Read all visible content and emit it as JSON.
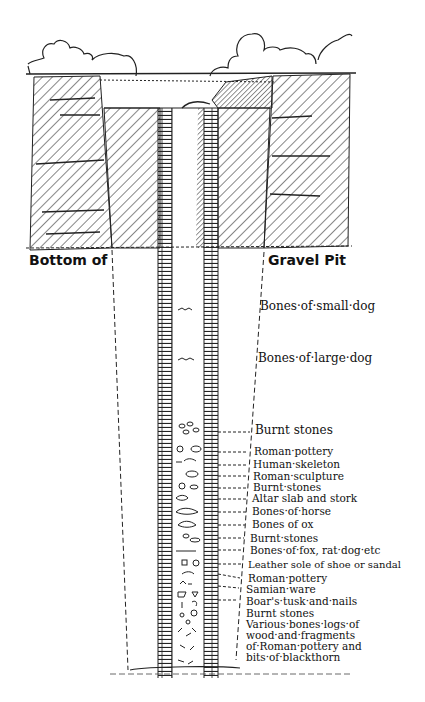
{
  "diagram": {
    "type": "archaeological well cross-section",
    "header_left": "Bottom of",
    "header_right": "Gravel Pit",
    "labels": [
      {
        "text": "Bones·of·small·dog",
        "y": 305
      },
      {
        "text": "Bones·of·large·dog",
        "y": 357
      },
      {
        "text": "Burnt stones",
        "y": 427
      },
      {
        "text": "Roman·pottery",
        "y": 447
      },
      {
        "text": "Human·skeleton",
        "y": 461
      },
      {
        "text": "Roman·sculpture",
        "y": 475
      },
      {
        "text": "Burnt·stones",
        "y": 487
      },
      {
        "text": "Altar slab and stork",
        "y": 499
      },
      {
        "text": "Bones·of·horse",
        "y": 512
      },
      {
        "text": "Bones of ox",
        "y": 525
      },
      {
        "text": "Burnt·stones",
        "y": 539
      },
      {
        "text": "Bones·of·fox, rat·dog·etc",
        "y": 551
      },
      {
        "text": "Leather sole of shoe or sandal",
        "y": 566
      },
      {
        "text": "Roman·pottery",
        "y": 578
      },
      {
        "text": "Samian·ware",
        "y": 590
      },
      {
        "text": "Boar's·tusk·and·nails",
        "y": 602
      },
      {
        "text": "Burnt stones",
        "y": 614
      },
      {
        "text": "Various·bones·logs·of",
        "y": 626
      },
      {
        "text": "wood·and·fragments",
        "y": 637
      },
      {
        "text": "of·Roman·pottery and",
        "y": 648
      },
      {
        "text": "bits·of·blackthorn",
        "y": 659
      }
    ]
  }
}
